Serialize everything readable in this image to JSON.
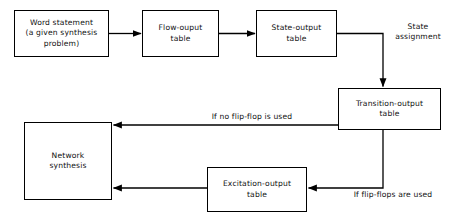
{
  "diagram": {
    "background_color": "#ffffff",
    "line_color": "#000000",
    "text_color": "#111111",
    "nodes": [
      {
        "id": "word-statement",
        "label": "Word statement\n(a given synthesis\nproblem)"
      },
      {
        "id": "flow-output",
        "label": "Flow-ouput\ntable"
      },
      {
        "id": "state-output",
        "label": "State-output\ntable"
      },
      {
        "id": "transition-output",
        "label": "Transition-output\ntable"
      },
      {
        "id": "network-synthesis",
        "label": "Network\nsynthesis"
      },
      {
        "id": "excitation-output",
        "label": "Excitation-output\ntable"
      }
    ],
    "edge_labels": [
      {
        "id": "state-assignment",
        "label": "State\nassignment"
      },
      {
        "id": "no-flip-flop",
        "label": "If no flip-flop is used"
      },
      {
        "id": "flip-flops-used",
        "label": "If flip-flops are used"
      }
    ],
    "edges": [
      {
        "from": "word-statement",
        "to": "flow-output",
        "label": ""
      },
      {
        "from": "flow-output",
        "to": "state-output",
        "label": ""
      },
      {
        "from": "state-output",
        "to": "transition-output",
        "label": "State assignment"
      },
      {
        "from": "transition-output",
        "to": "network-synthesis",
        "label": "If no flip-flop is used"
      },
      {
        "from": "transition-output",
        "to": "excitation-output",
        "label": "If flip-flops are used"
      },
      {
        "from": "excitation-output",
        "to": "network-synthesis",
        "label": ""
      }
    ]
  }
}
